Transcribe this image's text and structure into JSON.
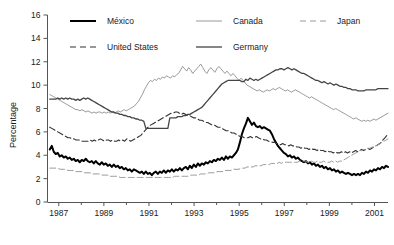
{
  "chart_data": {
    "type": "line",
    "title": "",
    "subtitle": "",
    "xlabel": "",
    "ylabel": "Percentage",
    "xlim": [
      1986.5,
      2001.6
    ],
    "ylim": [
      0,
      16
    ],
    "ytick_step": 2,
    "yticks": [
      "0",
      "2",
      "4",
      "6",
      "8",
      "10",
      "12",
      "14",
      "16"
    ],
    "xticks": [
      "1987",
      "1989",
      "1991",
      "1993",
      "1995",
      "1997",
      "1999",
      "2001"
    ],
    "xtick_values": [
      1987,
      1989,
      1991,
      1993,
      1995,
      1997,
      1999,
      2001
    ],
    "xminor_values": [
      1988,
      1990,
      1992,
      1994,
      1996,
      1998,
      2000
    ],
    "grid": false,
    "legend_position": "top-inside",
    "x_start": 1986.6,
    "x_end": 2001.6,
    "series": [
      {
        "name": "México",
        "color": "#000000",
        "width": 2.0,
        "dash": "none",
        "values": [
          4.5,
          4.8,
          4.3,
          4.1,
          4.2,
          3.9,
          4.0,
          3.8,
          3.9,
          3.7,
          3.8,
          3.6,
          3.7,
          3.5,
          3.6,
          3.4,
          3.6,
          3.5,
          3.7,
          3.5,
          3.4,
          3.5,
          3.3,
          3.5,
          3.3,
          3.2,
          3.4,
          3.2,
          3.3,
          3.1,
          3.2,
          3.0,
          3.2,
          3.0,
          3.1,
          2.9,
          3.0,
          2.8,
          2.9,
          2.7,
          2.8,
          2.6,
          2.8,
          2.7,
          2.6,
          2.5,
          2.6,
          2.4,
          2.6,
          2.4,
          2.5,
          2.3,
          2.5,
          2.6,
          2.4,
          2.6,
          2.5,
          2.7,
          2.5,
          2.7,
          2.6,
          2.8,
          2.6,
          2.8,
          2.7,
          2.9,
          2.7,
          2.9,
          3.0,
          2.8,
          3.1,
          2.9,
          3.2,
          3.0,
          3.3,
          3.1,
          3.3,
          3.2,
          3.4,
          3.3,
          3.5,
          3.4,
          3.6,
          3.5,
          3.7,
          3.6,
          3.8,
          3.6,
          3.9,
          3.7,
          3.9,
          3.8,
          4.0,
          4.2,
          4.5,
          5.1,
          5.8,
          6.3,
          6.7,
          7.2,
          6.9,
          6.6,
          6.8,
          6.5,
          6.4,
          6.5,
          6.3,
          6.4,
          6.3,
          6.2,
          6.1,
          5.8,
          5.4,
          5.1,
          4.8,
          4.6,
          4.4,
          4.2,
          4.1,
          3.9,
          4.0,
          3.8,
          3.9,
          3.7,
          3.8,
          3.6,
          3.5,
          3.4,
          3.5,
          3.3,
          3.4,
          3.2,
          3.3,
          3.1,
          3.2,
          3.0,
          3.1,
          2.9,
          3.0,
          2.8,
          2.9,
          2.7,
          2.8,
          2.6,
          2.7,
          2.5,
          2.6,
          2.5,
          2.4,
          2.5,
          2.4,
          2.3,
          2.4,
          2.3,
          2.4,
          2.3,
          2.5,
          2.4,
          2.6,
          2.5,
          2.7,
          2.6,
          2.8,
          2.7,
          2.9,
          2.8,
          3.0,
          2.9,
          3.1,
          3.0
        ]
      },
      {
        "name": "United States",
        "color": "#333333",
        "width": 1.1,
        "dash": "6,3",
        "values": [
          6.4,
          6.3,
          6.2,
          6.1,
          6.0,
          5.9,
          5.8,
          5.7,
          5.6,
          5.5,
          5.5,
          5.4,
          5.4,
          5.3,
          5.3,
          5.3,
          5.2,
          5.2,
          5.2,
          5.2,
          5.3,
          5.2,
          5.3,
          5.2,
          5.3,
          5.4,
          5.3,
          5.2,
          5.3,
          5.3,
          5.2,
          5.3,
          5.2,
          5.2,
          5.3,
          5.2,
          5.3,
          5.2,
          5.4,
          5.3,
          5.2,
          5.3,
          5.4,
          5.5,
          5.6,
          5.7,
          5.9,
          6.1,
          6.3,
          6.5,
          6.6,
          6.7,
          6.8,
          6.9,
          7.0,
          7.1,
          7.2,
          7.3,
          7.4,
          7.5,
          7.6,
          7.6,
          7.7,
          7.7,
          7.6,
          7.5,
          7.6,
          7.5,
          7.4,
          7.4,
          7.3,
          7.2,
          7.2,
          7.1,
          7.0,
          7.0,
          6.9,
          6.8,
          6.8,
          6.7,
          6.6,
          6.6,
          6.5,
          6.4,
          6.4,
          6.3,
          6.2,
          6.1,
          6.1,
          6.0,
          5.9,
          5.9,
          5.8,
          5.7,
          5.6,
          5.6,
          5.5,
          5.5,
          5.5,
          5.6,
          5.5,
          5.5,
          5.6,
          5.5,
          5.4,
          5.4,
          5.3,
          5.3,
          5.2,
          5.2,
          5.1,
          5.1,
          5.0,
          5.0,
          4.9,
          5.0,
          4.9,
          4.9,
          4.8,
          4.9,
          4.8,
          4.8,
          4.7,
          4.7,
          4.6,
          4.7,
          4.6,
          4.6,
          4.5,
          4.6,
          4.5,
          4.5,
          4.4,
          4.5,
          4.4,
          4.4,
          4.3,
          4.4,
          4.3,
          4.3,
          4.2,
          4.3,
          4.2,
          4.2,
          4.3,
          4.2,
          4.3,
          4.2,
          4.3,
          4.2,
          4.3,
          4.4,
          4.3,
          4.4,
          4.5,
          4.4,
          4.5,
          4.6,
          4.5,
          4.6,
          4.7,
          4.8,
          4.9,
          5.0,
          5.2,
          5.4,
          5.6,
          5.8
        ]
      },
      {
        "name": "Canada",
        "color": "#999999",
        "width": 1.0,
        "dash": "none",
        "values": [
          9.2,
          9.1,
          9.0,
          8.9,
          8.8,
          8.7,
          8.6,
          8.5,
          8.4,
          8.3,
          8.2,
          8.1,
          8.0,
          7.9,
          7.9,
          7.8,
          7.9,
          7.8,
          7.7,
          7.8,
          7.7,
          7.6,
          7.7,
          7.6,
          7.7,
          7.7,
          7.6,
          7.7,
          7.6,
          7.7,
          7.6,
          7.7,
          7.6,
          7.7,
          7.8,
          7.7,
          7.8,
          7.9,
          7.8,
          7.9,
          8.0,
          8.1,
          8.2,
          8.4,
          8.6,
          8.9,
          9.2,
          9.6,
          9.9,
          10.2,
          10.4,
          10.3,
          10.5,
          10.4,
          10.6,
          10.5,
          10.7,
          10.6,
          10.8,
          10.7,
          10.6,
          10.8,
          10.7,
          10.9,
          11.0,
          11.3,
          11.6,
          11.4,
          11.2,
          11.5,
          11.3,
          11.0,
          11.2,
          11.4,
          11.6,
          11.8,
          11.5,
          11.2,
          11.0,
          11.3,
          11.5,
          11.3,
          11.1,
          11.4,
          11.6,
          11.4,
          11.2,
          11.0,
          11.2,
          11.0,
          10.8,
          11.0,
          10.8,
          10.6,
          10.4,
          10.6,
          10.4,
          10.2,
          10.0,
          9.9,
          9.8,
          9.7,
          9.6,
          9.5,
          9.6,
          9.5,
          9.4,
          9.5,
          9.6,
          9.5,
          9.6,
          9.7,
          9.6,
          9.7,
          9.8,
          9.7,
          9.6,
          9.5,
          9.6,
          9.5,
          9.4,
          9.5,
          9.6,
          9.5,
          9.4,
          9.3,
          9.2,
          9.1,
          9.0,
          8.9,
          9.0,
          8.9,
          8.8,
          8.7,
          8.6,
          8.5,
          8.4,
          8.3,
          8.2,
          8.1,
          8.0,
          7.9,
          8.0,
          7.9,
          7.8,
          7.7,
          7.6,
          7.5,
          7.4,
          7.3,
          7.2,
          7.1,
          7.2,
          7.1,
          7.0,
          6.9,
          7.0,
          6.9,
          7.0,
          6.9,
          7.0,
          7.1,
          7.0,
          7.1,
          7.2,
          7.3,
          7.4,
          7.5,
          7.6
        ]
      },
      {
        "name": "Germany",
        "color": "#444444",
        "width": 1.3,
        "dash": "none",
        "values": [
          8.8,
          8.8,
          8.8,
          8.8,
          8.9,
          8.8,
          8.9,
          8.8,
          8.9,
          8.8,
          8.9,
          8.8,
          8.8,
          8.7,
          8.8,
          8.7,
          8.8,
          8.9,
          8.8,
          8.9,
          8.8,
          8.7,
          8.6,
          8.5,
          8.4,
          8.3,
          8.2,
          8.1,
          8.0,
          7.9,
          7.8,
          7.7,
          7.7,
          7.6,
          7.6,
          7.5,
          7.5,
          7.4,
          7.4,
          7.3,
          7.3,
          7.2,
          7.2,
          7.1,
          7.1,
          7.0,
          7.0,
          6.9,
          6.3,
          6.3,
          6.3,
          6.3,
          6.3,
          6.3,
          6.3,
          6.3,
          6.3,
          6.3,
          6.3,
          6.3,
          7.2,
          7.2,
          7.2,
          7.2,
          7.3,
          7.3,
          7.3,
          7.4,
          7.4,
          7.5,
          7.5,
          7.6,
          7.7,
          7.8,
          7.9,
          8.0,
          8.1,
          8.3,
          8.5,
          8.7,
          8.9,
          9.1,
          9.3,
          9.5,
          9.7,
          9.9,
          10.1,
          10.2,
          10.3,
          10.4,
          10.4,
          10.4,
          10.4,
          10.4,
          10.4,
          10.4,
          10.3,
          10.3,
          10.5,
          10.4,
          10.6,
          10.5,
          10.4,
          10.5,
          10.4,
          10.5,
          10.6,
          10.7,
          10.8,
          10.9,
          11.0,
          11.1,
          11.2,
          11.3,
          11.3,
          11.4,
          11.4,
          11.3,
          11.4,
          11.5,
          11.4,
          11.3,
          11.4,
          11.3,
          11.2,
          11.1,
          11.0,
          11.0,
          10.9,
          10.8,
          10.7,
          10.6,
          10.5,
          10.4,
          10.4,
          10.3,
          10.2,
          10.3,
          10.2,
          10.1,
          10.2,
          10.1,
          10.0,
          10.1,
          10.0,
          9.9,
          9.9,
          9.8,
          9.8,
          9.7,
          9.7,
          9.6,
          9.6,
          9.6,
          9.5,
          9.5,
          9.5,
          9.5,
          9.6,
          9.6,
          9.6,
          9.6,
          9.6,
          9.6,
          9.7,
          9.7,
          9.7,
          9.7,
          9.7,
          9.7
        ]
      },
      {
        "name": "Japan",
        "color": "#9a9a9a",
        "width": 1.0,
        "dash": "6,3",
        "values": [
          2.9,
          2.9,
          2.9,
          2.9,
          2.9,
          2.8,
          2.8,
          2.8,
          2.8,
          2.7,
          2.7,
          2.7,
          2.7,
          2.6,
          2.6,
          2.6,
          2.6,
          2.5,
          2.5,
          2.5,
          2.5,
          2.4,
          2.4,
          2.4,
          2.4,
          2.4,
          2.3,
          2.3,
          2.3,
          2.3,
          2.2,
          2.2,
          2.2,
          2.2,
          2.2,
          2.1,
          2.1,
          2.1,
          2.1,
          2.1,
          2.1,
          2.1,
          2.1,
          2.1,
          2.1,
          2.1,
          2.1,
          2.1,
          2.1,
          2.1,
          2.1,
          2.1,
          2.1,
          2.1,
          2.1,
          2.1,
          2.1,
          2.1,
          2.1,
          2.1,
          2.1,
          2.1,
          2.2,
          2.2,
          2.2,
          2.2,
          2.2,
          2.2,
          2.2,
          2.2,
          2.3,
          2.3,
          2.3,
          2.3,
          2.3,
          2.4,
          2.4,
          2.4,
          2.4,
          2.5,
          2.5,
          2.5,
          2.5,
          2.6,
          2.6,
          2.6,
          2.6,
          2.7,
          2.7,
          2.7,
          2.7,
          2.8,
          2.8,
          2.8,
          2.8,
          2.9,
          2.9,
          2.9,
          3.0,
          3.0,
          3.0,
          3.0,
          3.1,
          3.1,
          3.1,
          3.1,
          3.2,
          3.2,
          3.2,
          3.2,
          3.3,
          3.3,
          3.3,
          3.3,
          3.4,
          3.3,
          3.4,
          3.4,
          3.4,
          3.4,
          3.4,
          3.4,
          3.4,
          3.4,
          3.5,
          3.5,
          3.5,
          3.5,
          3.4,
          3.4,
          3.5,
          3.4,
          3.4,
          3.5,
          3.4,
          3.4,
          3.5,
          3.4,
          3.4,
          3.4,
          3.5,
          3.4,
          3.5,
          3.4,
          3.5,
          3.5,
          3.6,
          3.7,
          3.8,
          3.9,
          4.0,
          4.1,
          4.2,
          4.3,
          4.4,
          4.4,
          4.5,
          4.5,
          4.6,
          4.6,
          4.7,
          4.7,
          4.8,
          4.9,
          5.0,
          5.1,
          5.2,
          5.3,
          5.4
        ]
      }
    ]
  },
  "legend": {
    "entries": [
      {
        "label": "México"
      },
      {
        "label": "Canada"
      },
      {
        "label": "Japan"
      },
      {
        "label": "United States"
      },
      {
        "label": "Germany"
      }
    ]
  }
}
